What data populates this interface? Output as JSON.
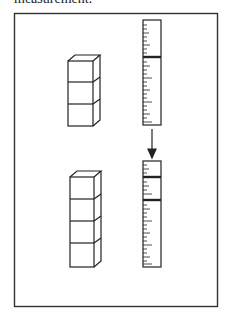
{
  "caption": {
    "text": "measurement."
  },
  "figure": {
    "frame": {
      "x": 14,
      "y": 13,
      "w": 203,
      "h": 293,
      "color": "#333333"
    },
    "top_panel": {
      "cube_stack": {
        "count": 3,
        "label": "stack of 3 cubes"
      },
      "ruler": {
        "label": "ruler with single thick mark"
      }
    },
    "arrow": {
      "direction": "down",
      "label": "transformation arrow"
    },
    "bottom_panel": {
      "cube_stack": {
        "count": 4,
        "label": "stack of 4 cubes"
      },
      "ruler": {
        "label": "ruler with two thick marks"
      }
    },
    "stroke_color": "#222222"
  }
}
